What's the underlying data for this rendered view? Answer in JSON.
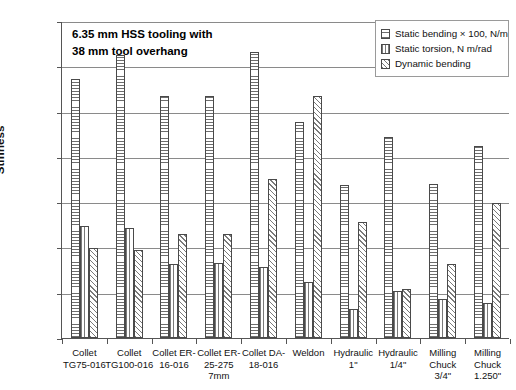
{
  "annotation": {
    "line1": "6.35 mm HSS tooling with",
    "line2": "38 mm tool overhang"
  },
  "legend": {
    "position": "top-right",
    "entries": [
      {
        "label": "Static bending × 100, N/m",
        "pattern": "horizontal-hatch"
      },
      {
        "label": "Static torsion, N m/rad",
        "pattern": "vertical-hatch"
      },
      {
        "label": "Dynamic bending",
        "pattern": "diagonal-hatch"
      }
    ]
  },
  "chart_data": {
    "type": "bar",
    "title": "",
    "xlabel": "",
    "ylabel": "Stiffness",
    "ylim": [
      0,
      7000
    ],
    "ytick_step": 1000,
    "yticks": [
      "0",
      "1000",
      "2000",
      "3000",
      "4000",
      "5000",
      "6000",
      "7000"
    ],
    "grid": true,
    "categories": [
      "Collet\nTG75-016",
      "Collet\nTG100-016",
      "Collet ER-\n16-016",
      "Collet ER-\n25-275\n7mm",
      "Collet DA-\n18-016",
      "Weldon",
      "Hydraulic\n1\"",
      "Hydraulic\n1/4\"",
      "Milling\nChuck\n3/4\"",
      "Milling\nChuck\n1.250\""
    ],
    "series": [
      {
        "name": "Static bending × 100, N/m",
        "values": [
          5710,
          6240,
          5340,
          5340,
          6320,
          4770,
          3380,
          4440,
          3390,
          4250
        ]
      },
      {
        "name": "Static torsion, N m/rad",
        "values": [
          2480,
          2420,
          1640,
          1660,
          1560,
          1230,
          640,
          1030,
          870,
          780
        ]
      },
      {
        "name": "Dynamic bending",
        "values": [
          1990,
          1950,
          2290,
          2300,
          3520,
          5340,
          2560,
          1090,
          1640,
          2990
        ]
      }
    ]
  }
}
